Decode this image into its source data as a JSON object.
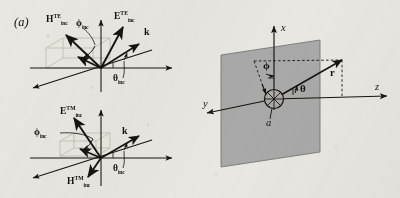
{
  "figure": {
    "panel_label": "(a)",
    "caption_present": false,
    "background_color": "#e9e7e2",
    "ink_color": "#16140f",
    "plane_fill_color": "#a9a9a9",
    "construction_line_color": "#b9b4ab"
  },
  "diagram_te": {
    "name": "TE incident-field coordinate diagram",
    "labels": {
      "h_vector": {
        "symbol": "H",
        "superscript": "TE",
        "subscript": "inc"
      },
      "e_vector": {
        "symbol": "E",
        "superscript": "TE",
        "subscript": "inc"
      },
      "phi_angle": {
        "symbol": "ϕ",
        "subscript": "inc"
      },
      "theta_angle": {
        "symbol": "θ",
        "subscript": "inc"
      },
      "k_vector": {
        "symbol": "k"
      }
    }
  },
  "diagram_tm": {
    "name": "TM incident-field coordinate diagram",
    "labels": {
      "e_vector": {
        "symbol": "E",
        "superscript": "TM",
        "subscript": "inc"
      },
      "h_vector": {
        "symbol": "H",
        "superscript": "TM",
        "subscript": "inc"
      },
      "phi_angle": {
        "symbol": "ϕ",
        "subscript": "inc"
      },
      "theta_angle": {
        "symbol": "θ",
        "subscript": "inc"
      },
      "k_vector": {
        "symbol": "k"
      }
    }
  },
  "diagram_sphere": {
    "name": "spherical coordinate geometry with scattering plane",
    "labels": {
      "axis_x": "x",
      "axis_y": "y",
      "axis_z": "z",
      "phi_angle": "ϕ",
      "theta_angle": "θ",
      "r_vector": "r",
      "aperture": "a"
    }
  }
}
